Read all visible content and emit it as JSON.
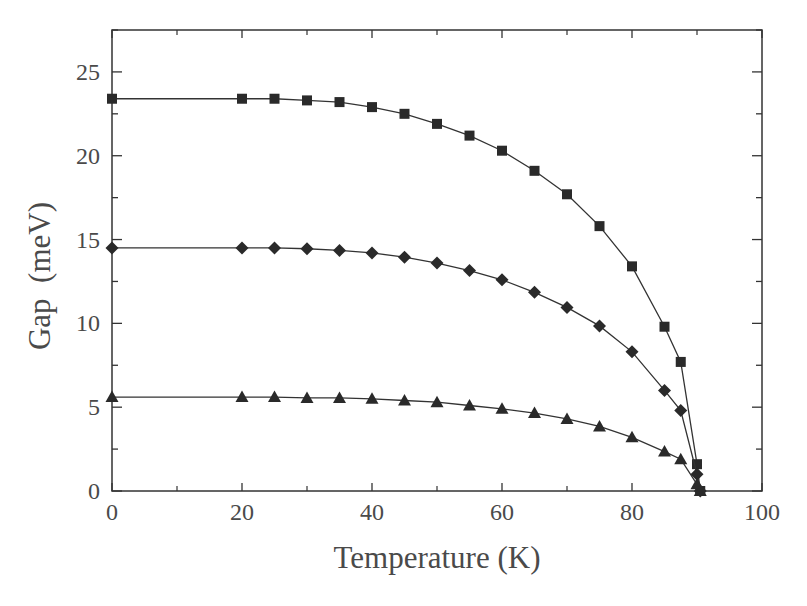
{
  "chart_data": {
    "type": "line",
    "title": "",
    "xlabel": "Temperature (K)",
    "ylabel": "Gap  (meV)",
    "xlim": [
      0,
      100
    ],
    "ylim": [
      0,
      27.5
    ],
    "xticks": [
      0,
      20,
      40,
      60,
      80,
      100
    ],
    "yticks": [
      0,
      5,
      10,
      15,
      20,
      25
    ],
    "grid": false,
    "legend": null,
    "series": [
      {
        "name": "squares",
        "marker": "square",
        "x": [
          0,
          20,
          25,
          30,
          35,
          40,
          45,
          50,
          55,
          60,
          65,
          70,
          75,
          80,
          85,
          87.5,
          90,
          90.5
        ],
        "y": [
          23.4,
          23.4,
          23.4,
          23.3,
          23.2,
          22.9,
          22.5,
          21.9,
          21.2,
          20.3,
          19.1,
          17.7,
          15.8,
          13.4,
          9.8,
          7.7,
          1.6,
          0
        ]
      },
      {
        "name": "diamonds",
        "marker": "diamond",
        "x": [
          0,
          20,
          25,
          30,
          35,
          40,
          45,
          50,
          55,
          60,
          65,
          70,
          75,
          80,
          85,
          87.5,
          90,
          90.5
        ],
        "y": [
          14.5,
          14.5,
          14.5,
          14.45,
          14.35,
          14.2,
          13.95,
          13.6,
          13.15,
          12.6,
          11.85,
          10.95,
          9.85,
          8.3,
          6.0,
          4.8,
          1.0,
          0
        ]
      },
      {
        "name": "triangles",
        "marker": "triangle",
        "x": [
          0,
          20,
          25,
          30,
          35,
          40,
          45,
          50,
          55,
          60,
          65,
          70,
          75,
          80,
          85,
          87.5,
          90,
          90.5
        ],
        "y": [
          5.6,
          5.6,
          5.6,
          5.55,
          5.55,
          5.5,
          5.4,
          5.3,
          5.1,
          4.9,
          4.65,
          4.3,
          3.85,
          3.2,
          2.35,
          1.9,
          0.4,
          0
        ]
      }
    ]
  }
}
